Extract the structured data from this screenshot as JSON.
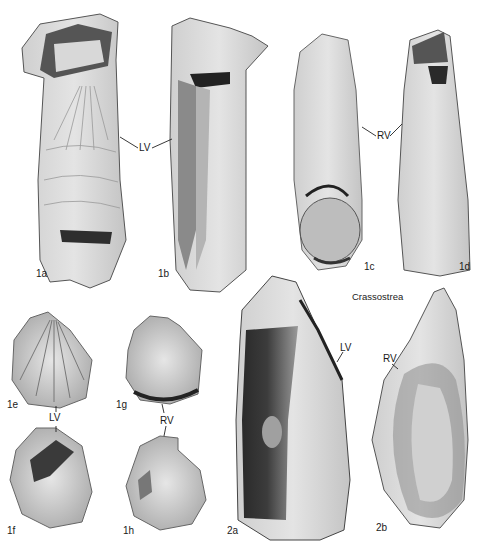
{
  "plate": {
    "genus_label": "Crassostrea",
    "figures": [
      {
        "id": "1a",
        "label": "1a",
        "view": "exterior",
        "valve": "LV"
      },
      {
        "id": "1b",
        "label": "1b",
        "view": "interior",
        "valve": "LV"
      },
      {
        "id": "1c",
        "label": "1c",
        "view": "exterior",
        "valve": "RV"
      },
      {
        "id": "1d",
        "label": "1d",
        "view": "interior",
        "valve": "RV"
      },
      {
        "id": "1e",
        "label": "1e",
        "view": "exterior",
        "valve": "LV"
      },
      {
        "id": "1f",
        "label": "1f",
        "view": "interior",
        "valve": "LV"
      },
      {
        "id": "1g",
        "label": "1g",
        "view": "exterior",
        "valve": "RV"
      },
      {
        "id": "1h",
        "label": "1h",
        "view": "interior",
        "valve": "RV"
      },
      {
        "id": "2a",
        "label": "2a",
        "view": "interior",
        "valve": "LV"
      },
      {
        "id": "2b",
        "label": "2b",
        "view": "interior",
        "valve": "RV"
      }
    ],
    "valve_labels": {
      "top_lv": "LV",
      "top_rv": "RV",
      "small_lv": "LV",
      "small_rv": "RV",
      "large_lv": "LV",
      "large_rv": "RV"
    }
  }
}
